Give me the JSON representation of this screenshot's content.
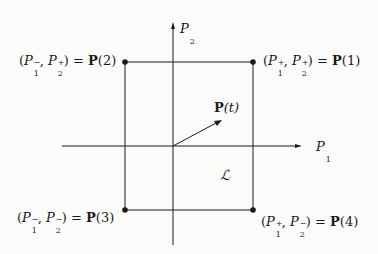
{
  "diagram": {
    "axes": {
      "x_label": {
        "var": "P",
        "sub": "1"
      },
      "y_label": {
        "var": "P",
        "sub": "2"
      }
    },
    "region_label": "ℒ",
    "vector_label": {
      "bold": "P",
      "arg": "(t)"
    },
    "corners": [
      {
        "id": "P2",
        "text_left": "(",
        "p1_sign": "−",
        "p2_sign": "+",
        "eq": ") = ",
        "bold": "P",
        "arg": "(2)"
      },
      {
        "id": "P1",
        "text_left": "(",
        "p1_sign": "+",
        "p2_sign": "+",
        "eq": ") = ",
        "bold": "P",
        "arg": "(1)"
      },
      {
        "id": "P3",
        "text_left": "(",
        "p1_sign": "−",
        "p2_sign": "−",
        "eq": ") = ",
        "bold": "P",
        "arg": "(3)"
      },
      {
        "id": "P4",
        "text_left": "(",
        "p1_sign": "+",
        "p2_sign": "−",
        "eq": ") = ",
        "bold": "P",
        "arg": "(4)"
      }
    ],
    "colors": {
      "ink": "#1a1a1a",
      "background": "#fbfbfa"
    }
  }
}
